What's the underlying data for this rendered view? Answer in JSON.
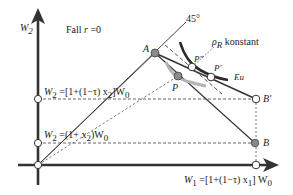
{
  "diagram": {
    "case_label": "Fall r = 0",
    "case_prefix": "Fall",
    "case_var": "r",
    "case_eq": " =0",
    "angle_label": "45°",
    "axes": {
      "y_label": "W",
      "y_sub": "2",
      "x_label_text": "W",
      "x_sub": "1",
      "x_label_rest": " =[1+(1−τ) x",
      "x_label_sub2": "1",
      "x_label_end": "] W",
      "x_label_sub3": "0"
    },
    "levels": {
      "upper_text": "W",
      "upper_sub": "2",
      "upper_rest": " =[1+(1−τ)  x",
      "upper_sub2": "2",
      "upper_end": "]W",
      "upper_sub3": "0",
      "lower_text": "W",
      "lower_sub": "2",
      "lower_rest": " =(1+ x",
      "lower_sub2": "2",
      "lower_end": ")W",
      "lower_sub3": "0"
    },
    "points": {
      "A": "A",
      "B": "B",
      "B_prime": "B'",
      "P": "P",
      "P_prime": "P'",
      "P_double_prime": "P\"",
      "Eu": "Eu"
    },
    "rho_label": "ρ",
    "rho_sub": "R",
    "rho_rest": " konstant",
    "colors": {
      "axis": "#333333",
      "dashed": "#555555",
      "filled_point": "#8a8a8a",
      "light_curve": "#b5b5b5",
      "dark_curve": "#2a2a2a"
    }
  }
}
